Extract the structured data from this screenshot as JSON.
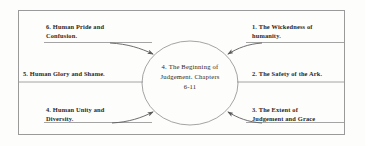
{
  "diagram": {
    "title_center": "4.  The Beginning of\nJudgement.  Chapters\n6-11",
    "frame_color": "#9a9a9a",
    "line_color": "#6f6f6f",
    "text_color": "#2b2723",
    "background": "#fdfdfc",
    "center": {
      "label": "4.  The Beginning of Judgement.  Chapters 6-11",
      "line1": "4.  The Beginning of",
      "line2": "Judgement.  Chapters",
      "line3": "6-11"
    },
    "branches": [
      {
        "id": "branch-6",
        "number": "6.",
        "text": "6.  Human Pride and\nConfusion.",
        "side": "left",
        "row": "top"
      },
      {
        "id": "branch-5",
        "number": "5.",
        "text": "5.  Human Glory and Shame.",
        "side": "left",
        "row": "middle"
      },
      {
        "id": "branch-4",
        "number": "4.",
        "text": "4.  Human Unity and\nDiversity.",
        "side": "left",
        "row": "bottom"
      },
      {
        "id": "branch-1",
        "number": "1.",
        "text": "1.  The Wickedness of\nhumanity.",
        "side": "right",
        "row": "top"
      },
      {
        "id": "branch-2",
        "number": "2.",
        "text": "2.  The Safety of the Ark.",
        "side": "right",
        "row": "middle"
      },
      {
        "id": "branch-3",
        "number": "3.",
        "text": "3.  The Extent of\nJudgement and Grace",
        "side": "right",
        "row": "bottom"
      }
    ]
  }
}
